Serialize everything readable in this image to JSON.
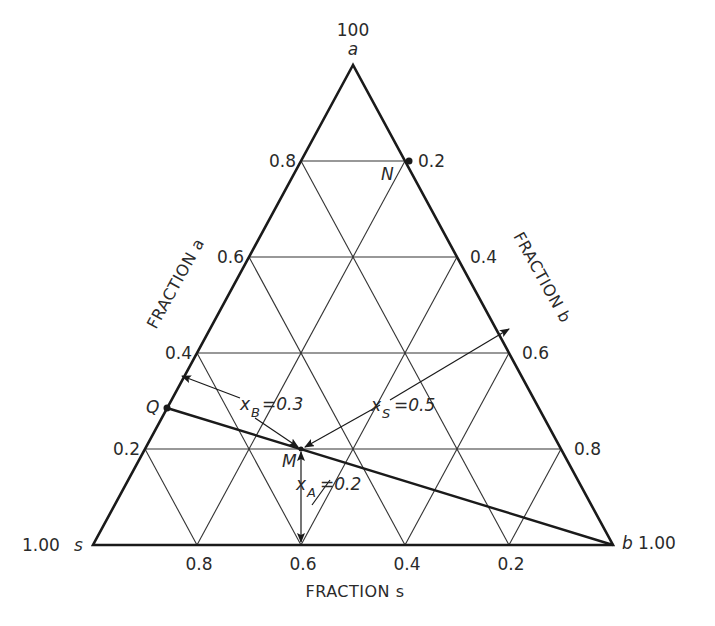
{
  "diagram": {
    "type": "ternary",
    "vertices": {
      "top": {
        "label": "a",
        "value": "100"
      },
      "bottom_left": {
        "label": "s",
        "value": "1.00"
      },
      "bottom_right": {
        "label": "b",
        "value": "1.00"
      }
    },
    "axis_titles": {
      "left": "FRACTION a",
      "right": "FRACTION b",
      "bottom": "FRACTION s"
    },
    "left_ticks": [
      "0.8",
      "0.6",
      "0.4",
      "0.2"
    ],
    "right_ticks": [
      "0.2",
      "0.4",
      "0.6",
      "0.8"
    ],
    "bottom_ticks": [
      "0.8",
      "0.6",
      "0.4",
      "0.2"
    ],
    "points": {
      "N": {
        "label": "N"
      },
      "Q": {
        "label": "Q"
      },
      "M": {
        "label": "M"
      }
    },
    "annotations": {
      "xB": {
        "var": "x",
        "sub": "B",
        "eq": "=0.3"
      },
      "xS": {
        "var": "x",
        "sub": "S",
        "eq": "=0.5"
      },
      "xA": {
        "var": "x",
        "sub": "A",
        "eq": "=0.2"
      }
    },
    "colors": {
      "line": "#1a1a1a",
      "grid": "#333333",
      "text": "#2a2a2a",
      "background": "#ffffff"
    }
  }
}
